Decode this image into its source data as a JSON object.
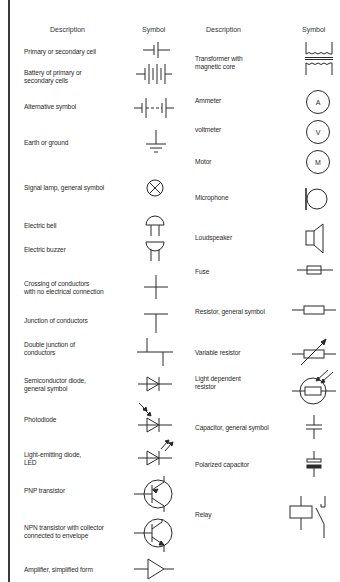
{
  "headers": {
    "left_description": "Description",
    "left_symbol": "Symbol",
    "right_description": "Description",
    "right_symbol": "Symbol"
  },
  "left_column": [
    {
      "description": "Primary or secondary cell",
      "icon": "cell-icon"
    },
    {
      "description": "Battery of primary or\nsecondary cells",
      "icon": "battery-icon"
    },
    {
      "description": "Alternative symbol",
      "icon": "battery-alt-icon"
    },
    {
      "description": "Earth or ground",
      "icon": "ground-icon"
    },
    {
      "description": "Signal lamp, general symbol",
      "icon": "lamp-icon"
    },
    {
      "description": "Electric bell",
      "icon": "bell-icon"
    },
    {
      "description": "Electric buzzer",
      "icon": "buzzer-icon"
    },
    {
      "description": "Crossing of conductors\nwith no electrical connection",
      "icon": "crossing-icon"
    },
    {
      "description": "Junction of conductors",
      "icon": "junction-icon"
    },
    {
      "description": "Double junction of\nconductors",
      "icon": "double-junction-icon"
    },
    {
      "description": "Semiconductor diode,\ngeneral symbol",
      "icon": "diode-icon"
    },
    {
      "description": "Photodiode",
      "icon": "photodiode-icon"
    },
    {
      "description": "Light-emitting diode,\nLED",
      "icon": "led-icon"
    },
    {
      "description": "PNP transistor",
      "icon": "pnp-transistor-icon"
    },
    {
      "description": "NPN transistor with collector\nconnected to envelope",
      "icon": "npn-transistor-icon"
    },
    {
      "description": "Amplifier, simplified form",
      "icon": "amplifier-icon"
    }
  ],
  "right_column": [
    {
      "description": "Transformer with\nmagnetic core",
      "icon": "transformer-icon"
    },
    {
      "description": "Ammeter",
      "icon": "ammeter-icon",
      "letter": "A"
    },
    {
      "description": "voltmeter",
      "icon": "voltmeter-icon",
      "letter": "V"
    },
    {
      "description": "Motor",
      "icon": "motor-icon",
      "letter": "M"
    },
    {
      "description": "Microphone",
      "icon": "microphone-icon"
    },
    {
      "description": "Loudspeaker",
      "icon": "loudspeaker-icon"
    },
    {
      "description": "Fuse",
      "icon": "fuse-icon"
    },
    {
      "description": "Resistor, general symbol",
      "icon": "resistor-icon"
    },
    {
      "description": "Variable resistor",
      "icon": "variable-resistor-icon"
    },
    {
      "description": "Light dependent\nresistor",
      "icon": "ldr-icon"
    },
    {
      "description": "Capacitor, general symbol",
      "icon": "capacitor-icon"
    },
    {
      "description": "Polarized capacitor",
      "icon": "polarized-capacitor-icon"
    },
    {
      "description": "Relay",
      "icon": "relay-icon"
    }
  ]
}
